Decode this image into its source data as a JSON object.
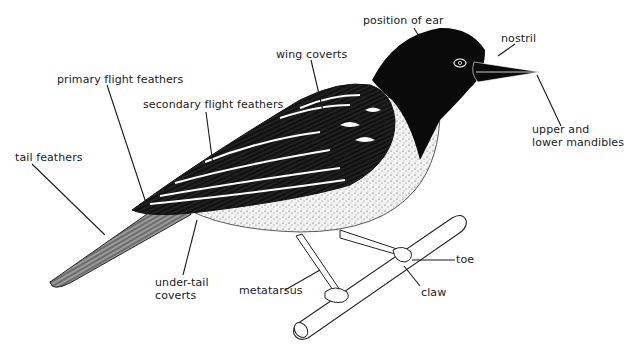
{
  "diagram": {
    "labels": [
      {
        "id": "position-of-ear",
        "text": "position of ear",
        "x": 363,
        "y": 14
      },
      {
        "id": "nostril",
        "text": "nostril",
        "x": 501,
        "y": 32
      },
      {
        "id": "wing-coverts",
        "text": "wing coverts",
        "x": 276,
        "y": 48
      },
      {
        "id": "primary-flight-feathers",
        "text": "primary flight feathers",
        "x": 57,
        "y": 73
      },
      {
        "id": "secondary-flight-feathers",
        "text": "secondary flight feathers",
        "x": 143,
        "y": 98
      },
      {
        "id": "upper-and-lower-mandibles",
        "text": "upper and\nlower mandibles",
        "x": 532,
        "y": 123
      },
      {
        "id": "tail-feathers",
        "text": "tail feathers",
        "x": 15,
        "y": 151
      },
      {
        "id": "under-tail-coverts",
        "text": "under-tail\ncoverts",
        "x": 155,
        "y": 276
      },
      {
        "id": "metatarsus",
        "text": "metatarsus",
        "x": 239,
        "y": 284
      },
      {
        "id": "toe",
        "text": "toe",
        "x": 456,
        "y": 253
      },
      {
        "id": "claw",
        "text": "claw",
        "x": 421,
        "y": 286
      }
    ]
  }
}
